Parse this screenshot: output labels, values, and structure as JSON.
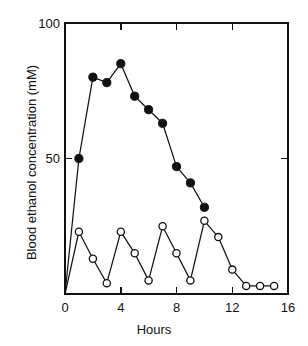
{
  "chart_data": {
    "type": "line",
    "title": "",
    "xlabel": "Hours",
    "ylabel": "Blood ethanol concentration (mM)",
    "xlim": [
      0,
      16
    ],
    "ylim": [
      0,
      100
    ],
    "xticks": [
      0,
      4,
      8,
      12,
      16
    ],
    "xtick_labels": [
      "0",
      "4",
      "8",
      "12",
      "16"
    ],
    "xminorticks": [
      2,
      6,
      10,
      14
    ],
    "yticks": [
      50,
      100
    ],
    "ytick_labels": [
      "50",
      "100"
    ],
    "grid": false,
    "legend_position": "none",
    "frame": "box",
    "series": [
      {
        "name": "filled-circle-series",
        "marker": "filled-circle",
        "x": [
          0,
          1,
          2,
          3,
          4,
          5,
          6,
          7,
          8,
          9,
          10
        ],
        "values": [
          0,
          50,
          80,
          78,
          85,
          73,
          68,
          63,
          47,
          41,
          32
        ]
      },
      {
        "name": "open-circle-series",
        "marker": "open-circle",
        "x": [
          0,
          1,
          2,
          3,
          4,
          5,
          6,
          7,
          8,
          9,
          10,
          11,
          12,
          13,
          14,
          15
        ],
        "values": [
          0,
          23,
          13,
          4,
          23,
          15,
          5,
          25,
          15,
          5,
          27,
          21,
          9,
          3,
          3,
          3
        ]
      }
    ]
  },
  "axis": {
    "ylabel": "Blood ethanol concentration (mM)",
    "xlabel": "Hours",
    "ytick_100": "100",
    "ytick_50": "50",
    "xtick_0": "0",
    "xtick_4": "4",
    "xtick_8": "8",
    "xtick_12": "12",
    "xtick_16": "16"
  },
  "caption": {
    "sliver_text": ""
  }
}
